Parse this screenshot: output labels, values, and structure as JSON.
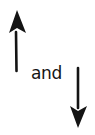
{
  "figure": {
    "connector_text": "and",
    "arrows": [
      {
        "direction": "up",
        "icon": "arrow-up-icon"
      },
      {
        "direction": "down",
        "icon": "arrow-down-icon"
      }
    ],
    "ink_color": "#141414",
    "background": "#ffffff"
  }
}
